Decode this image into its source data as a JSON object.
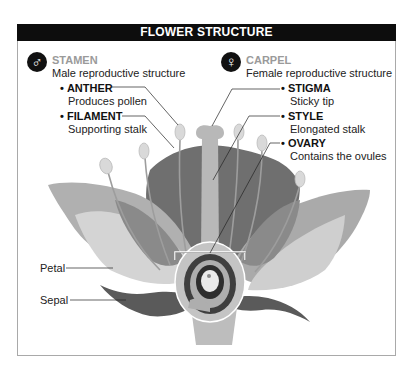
{
  "title": "FLOWER STRUCTURE",
  "stamen": {
    "icon": "male-symbol-icon",
    "glyph": "♂",
    "heading": "STAMEN",
    "subheading": "Male reproductive structure",
    "parts": [
      {
        "bullet": "•",
        "name": "ANTHER",
        "description": "Produces pollen"
      },
      {
        "bullet": "•",
        "name": "FILAMENT",
        "description": "Supporting stalk"
      }
    ]
  },
  "carpel": {
    "icon": "female-symbol-icon",
    "glyph": "♀",
    "heading": "CARPEL",
    "subheading": "Female reproductive structure",
    "parts": [
      {
        "bullet": "•",
        "name": "STIGMA",
        "description": "Sticky tip"
      },
      {
        "bullet": "•",
        "name": "STYLE",
        "description": "Elongated stalk"
      },
      {
        "bullet": "•",
        "name": "OVARY",
        "description": "Contains the ovules"
      }
    ]
  },
  "outer_labels": {
    "petal": "Petal",
    "sepal": "Sepal"
  },
  "colors": {
    "header_bg": "#0d0d0d",
    "header_text": "#ffffff",
    "section_heading": "#9a9a9a",
    "border": "#a9a9a9"
  }
}
